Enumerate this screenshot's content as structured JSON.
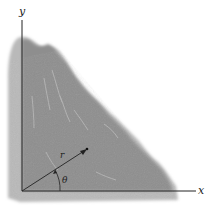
{
  "figure": {
    "axes": {
      "x_label": "x",
      "y_label": "y"
    },
    "vector": {
      "label": "r",
      "angle_label": "θ"
    },
    "caption": "",
    "colors": {
      "pile_fill": "#8e8e8e",
      "pile_edge": "#b4b4b4",
      "axis": "#222222",
      "background": "#ffffff"
    }
  }
}
